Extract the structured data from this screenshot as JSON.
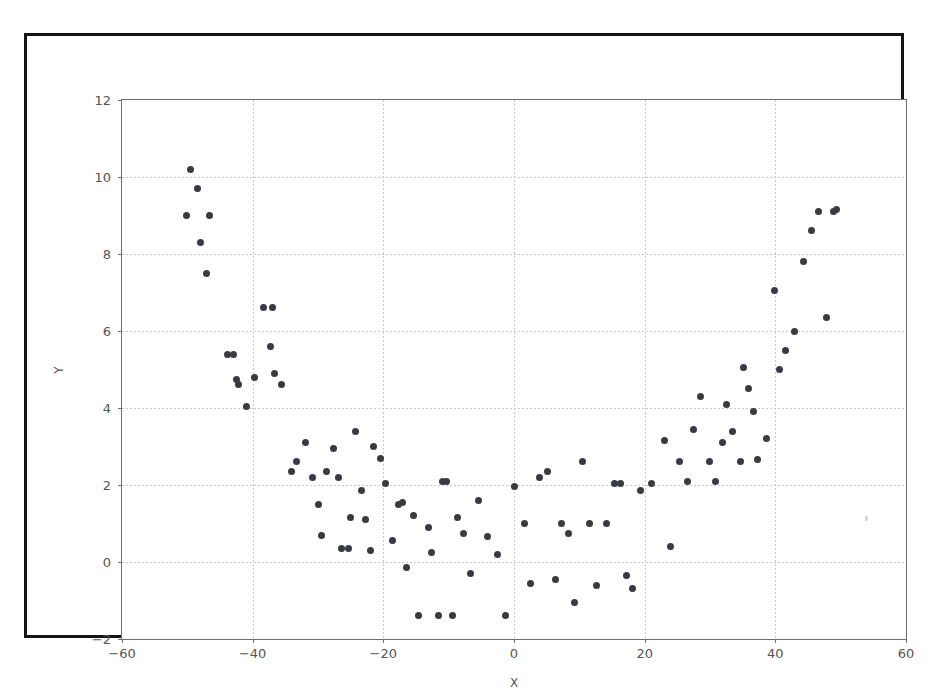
{
  "figure": {
    "background_color": "#ffffff",
    "frame_color": "#141414",
    "axes_color": "#6e6e6e",
    "grid_color": "#c9c9c9",
    "marker_color": "#3a3a42"
  },
  "chart_data": {
    "type": "scatter",
    "title": "",
    "xlabel": "X",
    "ylabel": "Y",
    "xlim": [
      -60,
      60
    ],
    "ylim": [
      -2,
      12
    ],
    "xticks": [
      -60,
      -40,
      -20,
      0,
      20,
      40,
      60
    ],
    "yticks": [
      -2,
      0,
      2,
      4,
      6,
      8,
      10,
      12
    ],
    "xticklabels": [
      "−60",
      "−40",
      "−20",
      "0",
      "20",
      "40",
      "60"
    ],
    "yticklabels": [
      "−2",
      "0",
      "2",
      "4",
      "6",
      "8",
      "10",
      "12"
    ],
    "grid": true,
    "grid_style": "dotted",
    "legend": null,
    "marker": "circle",
    "marker_size": 7,
    "series": [
      {
        "name": "data",
        "points": [
          [
            -49.5,
            10.2
          ],
          [
            -48.4,
            9.7
          ],
          [
            -50.2,
            9.0
          ],
          [
            -46.6,
            9.0
          ],
          [
            -48.0,
            8.3
          ],
          [
            -47.0,
            7.5
          ],
          [
            -43.9,
            5.4
          ],
          [
            -42.9,
            5.4
          ],
          [
            -42.5,
            4.75
          ],
          [
            -42.2,
            4.6
          ],
          [
            -41.0,
            4.05
          ],
          [
            -39.7,
            4.8
          ],
          [
            -38.3,
            6.6
          ],
          [
            -36.9,
            6.6
          ],
          [
            -37.3,
            5.6
          ],
          [
            -36.7,
            4.9
          ],
          [
            -35.6,
            4.6
          ],
          [
            -34.0,
            2.35
          ],
          [
            -33.3,
            2.6
          ],
          [
            -31.9,
            3.1
          ],
          [
            -30.9,
            2.2
          ],
          [
            -30.0,
            1.5
          ],
          [
            -29.5,
            0.7
          ],
          [
            -28.7,
            2.35
          ],
          [
            -27.6,
            2.95
          ],
          [
            -26.9,
            2.2
          ],
          [
            -26.4,
            0.35
          ],
          [
            -25.4,
            0.35
          ],
          [
            -25.0,
            1.15
          ],
          [
            -24.3,
            3.4
          ],
          [
            -23.3,
            1.85
          ],
          [
            -22.7,
            1.1
          ],
          [
            -22.0,
            0.3
          ],
          [
            -21.5,
            3.0
          ],
          [
            -20.4,
            2.7
          ],
          [
            -19.6,
            2.05
          ],
          [
            -18.6,
            0.55
          ],
          [
            -17.7,
            1.5
          ],
          [
            -17.0,
            1.55
          ],
          [
            -16.4,
            -0.15
          ],
          [
            -15.4,
            1.2
          ],
          [
            -14.6,
            -1.4
          ],
          [
            -13.1,
            0.9
          ],
          [
            -12.6,
            0.25
          ],
          [
            -11.6,
            -1.4
          ],
          [
            -10.9,
            2.1
          ],
          [
            -10.4,
            2.1
          ],
          [
            -9.4,
            -1.4
          ],
          [
            -8.6,
            1.15
          ],
          [
            -7.7,
            0.75
          ],
          [
            -6.6,
            -0.3
          ],
          [
            -5.4,
            1.6
          ],
          [
            -4.0,
            0.65
          ],
          [
            -2.6,
            0.2
          ],
          [
            -1.3,
            -1.4
          ],
          [
            0.0,
            1.95
          ],
          [
            1.6,
            1.0
          ],
          [
            2.6,
            -0.55
          ],
          [
            3.9,
            2.2
          ],
          [
            5.2,
            2.35
          ],
          [
            6.3,
            -0.45
          ],
          [
            7.2,
            1.0
          ],
          [
            8.4,
            0.75
          ],
          [
            9.3,
            -1.05
          ],
          [
            10.5,
            2.6
          ],
          [
            11.6,
            1.0
          ],
          [
            12.7,
            -0.6
          ],
          [
            14.1,
            1.0
          ],
          [
            15.4,
            2.05
          ],
          [
            16.3,
            2.05
          ],
          [
            17.2,
            -0.35
          ],
          [
            18.2,
            -0.7
          ],
          [
            19.3,
            1.85
          ],
          [
            21.0,
            2.05
          ],
          [
            23.0,
            3.15
          ],
          [
            24.0,
            0.4
          ],
          [
            25.3,
            2.6
          ],
          [
            26.6,
            2.1
          ],
          [
            27.4,
            3.45
          ],
          [
            28.6,
            4.3
          ],
          [
            29.9,
            2.6
          ],
          [
            30.8,
            2.1
          ],
          [
            31.9,
            3.1
          ],
          [
            32.6,
            4.1
          ],
          [
            33.5,
            3.4
          ],
          [
            34.6,
            2.6
          ],
          [
            35.2,
            5.05
          ],
          [
            35.9,
            4.5
          ],
          [
            36.6,
            3.9
          ],
          [
            37.2,
            2.65
          ],
          [
            38.6,
            3.2
          ],
          [
            39.9,
            7.05
          ],
          [
            40.7,
            5.0
          ],
          [
            41.5,
            5.5
          ],
          [
            43.0,
            6.0
          ],
          [
            44.3,
            7.8
          ],
          [
            45.5,
            8.6
          ],
          [
            46.6,
            9.1
          ],
          [
            48.9,
            9.1
          ],
          [
            49.4,
            9.15
          ],
          [
            47.9,
            6.35
          ]
        ]
      }
    ]
  }
}
